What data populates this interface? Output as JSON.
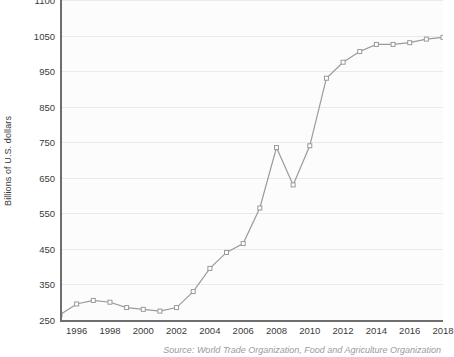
{
  "chart_data": {
    "type": "line",
    "title": "",
    "subtitle": "",
    "xlabel": "",
    "ylabel": "Billions of U.S. dollars",
    "grid": true,
    "legend": null,
    "legend_position": "none",
    "series_color": "#9a9a9a",
    "marker_color": "#9a9a9a",
    "x": [
      1995,
      1996,
      1997,
      1998,
      1999,
      2000,
      2001,
      2002,
      2003,
      2004,
      2005,
      2006,
      2007,
      2008,
      2009,
      2010,
      2011,
      2012,
      2013,
      2014,
      2015,
      2016,
      2017,
      2018
    ],
    "values": [
      265,
      295,
      305,
      300,
      285,
      280,
      275,
      285,
      330,
      395,
      440,
      465,
      565,
      735,
      630,
      740,
      930,
      975,
      1005,
      1025,
      1025,
      1030,
      1040,
      1045
    ],
    "xlim": [
      1995,
      2018
    ],
    "ylim": [
      250,
      1150
    ],
    "xtick_labels": [
      "1996",
      "1998",
      "2000",
      "2002",
      "2004",
      "2006",
      "2008",
      "2010",
      "2012",
      "2014",
      "2016",
      "2018"
    ],
    "xtick_values": [
      1996,
      1998,
      2000,
      2002,
      2004,
      2006,
      2008,
      2010,
      2012,
      2014,
      2016,
      2018
    ],
    "ytick_labels": [
      "250",
      "350",
      "450",
      "550",
      "650",
      "750",
      "850",
      "950",
      "1050",
      "1100"
    ],
    "ytick_values": [
      250,
      350,
      450,
      550,
      650,
      750,
      850,
      950,
      1050,
      1150
    ],
    "source": "Source: World Trade Organization, Food and Agriculture Organization"
  }
}
